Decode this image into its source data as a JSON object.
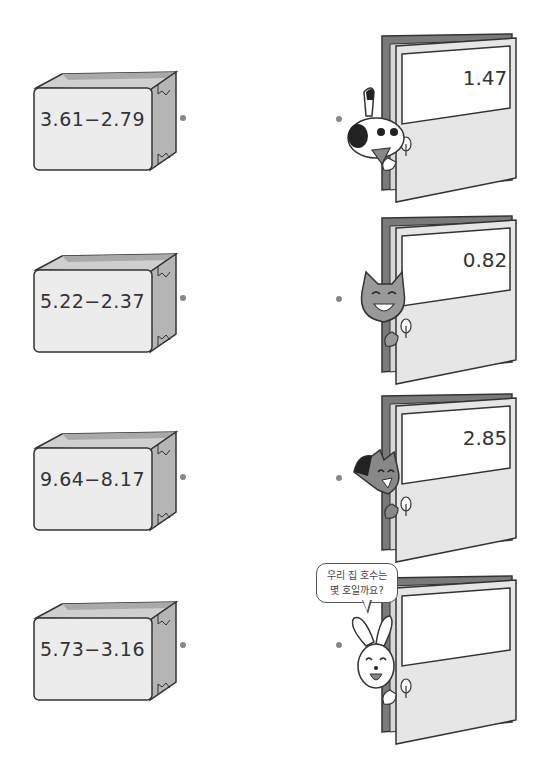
{
  "boxes": [
    {
      "expression": "3.61−2.79"
    },
    {
      "expression": "5.22−2.37"
    },
    {
      "expression": "9.64−8.17"
    },
    {
      "expression": "5.73−3.16"
    }
  ],
  "doors": [
    {
      "value": "1.47",
      "character": "dog"
    },
    {
      "value": "0.82",
      "character": "cat"
    },
    {
      "value": "2.85",
      "character": "wolf"
    },
    {
      "value": "",
      "character": "rabbit"
    }
  ],
  "speech_bubble": {
    "line1": "우리 집 호수는",
    "line2": "몇 호일까요?"
  },
  "colors": {
    "box_face": "#ececec",
    "box_side": "#b5b5b5",
    "door_frame": "#7a7a7a",
    "door_panel": "#e6e6e6",
    "outline": "#333333",
    "dot": "#888888"
  }
}
